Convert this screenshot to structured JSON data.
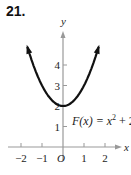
{
  "exercise_number": "21.",
  "chart_data": {
    "type": "line",
    "title": "",
    "function_label": "F(x) = x^2 + 2",
    "function_label_parts": {
      "lhs": "F(x) = x",
      "exp": "2",
      "rhs": " + 2"
    },
    "xlabel": "x",
    "ylabel": "y",
    "origin_label": "O",
    "x_ticks": [
      -2,
      -1,
      1,
      2
    ],
    "y_ticks": [
      1,
      2,
      3,
      4
    ],
    "xlim": [
      -2.9,
      3.2
    ],
    "ylim": [
      -0.3,
      5
    ],
    "curve": {
      "x": [
        -1.7,
        -1.5,
        -1,
        -0.5,
        0,
        0.5,
        1,
        1.5,
        1.7
      ],
      "y": [
        4.89,
        4.25,
        3,
        2.25,
        2,
        2.25,
        3,
        4.25,
        4.89
      ],
      "arrows_at_ends": true,
      "color": "#111111"
    },
    "axis_color": "#999999"
  }
}
